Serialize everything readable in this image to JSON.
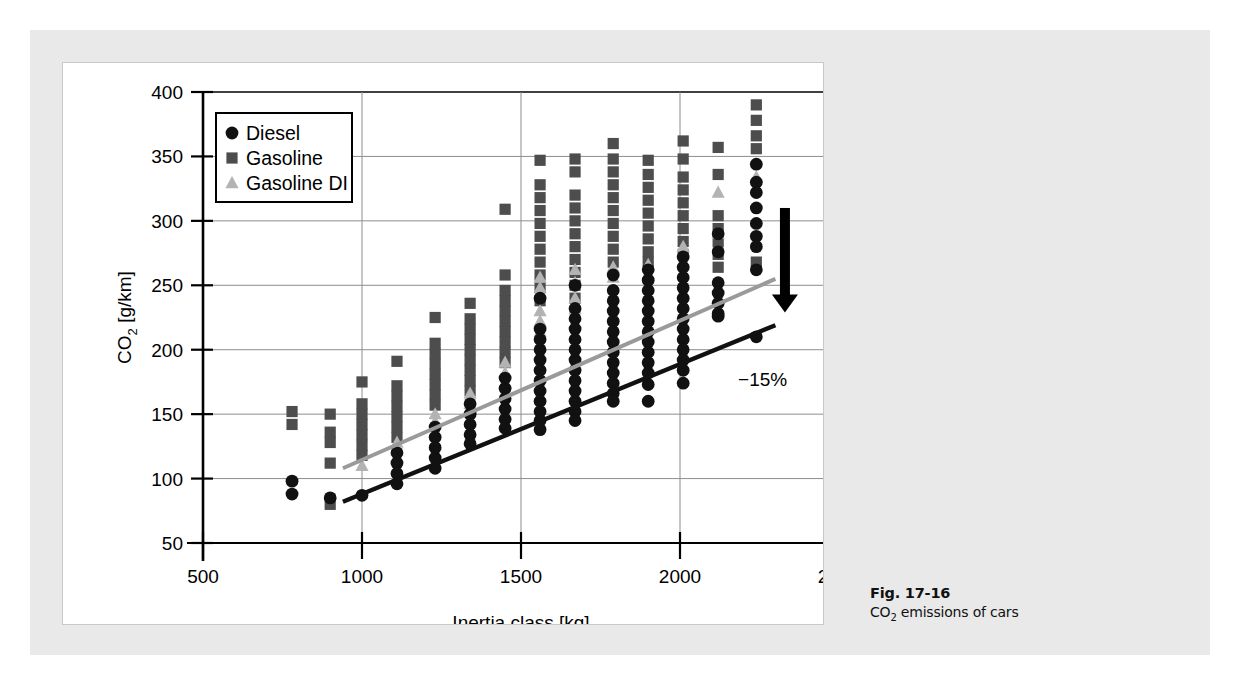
{
  "figure": {
    "caption_number": "Fig. 17-16",
    "caption_text_pre": "CO",
    "caption_text_sub": "2",
    "caption_text_post": " emissions of cars"
  },
  "colors": {
    "diesel": "#111111",
    "gasoline": "#4d4d4d",
    "gasoline_di": "#b3b3b3",
    "trend_diesel": "#111111",
    "trend_gasoline": "#9a9a9a",
    "panel_bg": "#e9e9e9",
    "plot_bg": "#ffffff",
    "grid": "#8d8d8d",
    "axis": "#000000"
  },
  "legend": {
    "position": "top-left-inside",
    "items": [
      {
        "label": "Diesel",
        "marker": "circle",
        "color": "#111111"
      },
      {
        "label": "Gasoline",
        "marker": "square",
        "color": "#4d4d4d"
      },
      {
        "label": "Gasoline DI",
        "marker": "triangle",
        "color": "#b3b3b3"
      }
    ]
  },
  "annotations": [
    {
      "name": "reduction-label",
      "text": "−15%",
      "x": 2260,
      "y": 172
    },
    {
      "name": "down-arrow",
      "text": "arrow-down-icon",
      "x": 2330,
      "y": 255
    }
  ],
  "chart_data": {
    "type": "scatter",
    "title": "",
    "xlabel": "Inertia class [kg]",
    "ylabel": "CO2 [g/km]",
    "ylabel_pre": "CO",
    "ylabel_sub": "2",
    "ylabel_post": " [g/km]",
    "xlim": [
      500,
      2500
    ],
    "ylim": [
      50,
      400
    ],
    "xticks": [
      500,
      1000,
      1500,
      2000,
      2500
    ],
    "yticks": [
      50,
      100,
      150,
      200,
      250,
      300,
      350,
      400
    ],
    "grid": true,
    "legend_position": "upper left",
    "series": [
      {
        "name": "Diesel",
        "marker": "circle",
        "color": "#111111",
        "points": [
          [
            780,
            98
          ],
          [
            780,
            88
          ],
          [
            900,
            85
          ],
          [
            1000,
            87
          ],
          [
            1110,
            120
          ],
          [
            1110,
            112
          ],
          [
            1110,
            104
          ],
          [
            1110,
            96
          ],
          [
            1230,
            140
          ],
          [
            1230,
            132
          ],
          [
            1230,
            124
          ],
          [
            1230,
            116
          ],
          [
            1230,
            108
          ],
          [
            1340,
            158
          ],
          [
            1340,
            150
          ],
          [
            1340,
            142
          ],
          [
            1340,
            134
          ],
          [
            1340,
            127
          ],
          [
            1450,
            178
          ],
          [
            1450,
            170
          ],
          [
            1450,
            162
          ],
          [
            1450,
            154
          ],
          [
            1450,
            146
          ],
          [
            1450,
            139
          ],
          [
            1560,
            240
          ],
          [
            1560,
            216
          ],
          [
            1560,
            208
          ],
          [
            1560,
            200
          ],
          [
            1560,
            192
          ],
          [
            1560,
            184
          ],
          [
            1560,
            176
          ],
          [
            1560,
            168
          ],
          [
            1560,
            160
          ],
          [
            1560,
            152
          ],
          [
            1560,
            145
          ],
          [
            1560,
            138
          ],
          [
            1670,
            250
          ],
          [
            1670,
            232
          ],
          [
            1670,
            224
          ],
          [
            1670,
            216
          ],
          [
            1670,
            208
          ],
          [
            1670,
            200
          ],
          [
            1670,
            192
          ],
          [
            1670,
            184
          ],
          [
            1670,
            176
          ],
          [
            1670,
            168
          ],
          [
            1670,
            160
          ],
          [
            1670,
            152
          ],
          [
            1670,
            145
          ],
          [
            1790,
            258
          ],
          [
            1790,
            246
          ],
          [
            1790,
            238
          ],
          [
            1790,
            230
          ],
          [
            1790,
            222
          ],
          [
            1790,
            214
          ],
          [
            1790,
            206
          ],
          [
            1790,
            198
          ],
          [
            1790,
            190
          ],
          [
            1790,
            182
          ],
          [
            1790,
            174
          ],
          [
            1790,
            166
          ],
          [
            1790,
            160
          ],
          [
            1900,
            262
          ],
          [
            1900,
            254
          ],
          [
            1900,
            246
          ],
          [
            1900,
            238
          ],
          [
            1900,
            230
          ],
          [
            1900,
            222
          ],
          [
            1900,
            214
          ],
          [
            1900,
            206
          ],
          [
            1900,
            198
          ],
          [
            1900,
            190
          ],
          [
            1900,
            182
          ],
          [
            1900,
            173
          ],
          [
            1900,
            160
          ],
          [
            2010,
            272
          ],
          [
            2010,
            264
          ],
          [
            2010,
            256
          ],
          [
            2010,
            248
          ],
          [
            2010,
            240
          ],
          [
            2010,
            232
          ],
          [
            2010,
            224
          ],
          [
            2010,
            216
          ],
          [
            2010,
            208
          ],
          [
            2010,
            200
          ],
          [
            2010,
            192
          ],
          [
            2010,
            184
          ],
          [
            2010,
            174
          ],
          [
            2120,
            290
          ],
          [
            2120,
            276
          ],
          [
            2120,
            252
          ],
          [
            2120,
            244
          ],
          [
            2120,
            236
          ],
          [
            2120,
            228
          ],
          [
            2120,
            226
          ],
          [
            2240,
            344
          ],
          [
            2240,
            330
          ],
          [
            2240,
            322
          ],
          [
            2240,
            310
          ],
          [
            2240,
            298
          ],
          [
            2240,
            288
          ],
          [
            2240,
            280
          ],
          [
            2240,
            262
          ],
          [
            2240,
            210
          ]
        ]
      },
      {
        "name": "Gasoline",
        "marker": "square",
        "color": "#4d4d4d",
        "points": [
          [
            780,
            152
          ],
          [
            780,
            142
          ],
          [
            900,
            150
          ],
          [
            900,
            136
          ],
          [
            900,
            128
          ],
          [
            900,
            112
          ],
          [
            900,
            80
          ],
          [
            1000,
            175
          ],
          [
            1000,
            158
          ],
          [
            1000,
            150
          ],
          [
            1000,
            142
          ],
          [
            1000,
            134
          ],
          [
            1000,
            126
          ],
          [
            1000,
            118
          ],
          [
            1110,
            191
          ],
          [
            1110,
            172
          ],
          [
            1110,
            164
          ],
          [
            1110,
            156
          ],
          [
            1110,
            148
          ],
          [
            1110,
            140
          ],
          [
            1110,
            132
          ],
          [
            1230,
            225
          ],
          [
            1230,
            205
          ],
          [
            1230,
            197
          ],
          [
            1230,
            189
          ],
          [
            1230,
            181
          ],
          [
            1230,
            173
          ],
          [
            1230,
            165
          ],
          [
            1230,
            157
          ],
          [
            1340,
            236
          ],
          [
            1340,
            224
          ],
          [
            1340,
            216
          ],
          [
            1340,
            208
          ],
          [
            1340,
            200
          ],
          [
            1340,
            192
          ],
          [
            1340,
            184
          ],
          [
            1340,
            176
          ],
          [
            1340,
            168
          ],
          [
            1450,
            309
          ],
          [
            1450,
            258
          ],
          [
            1450,
            246
          ],
          [
            1450,
            238
          ],
          [
            1450,
            230
          ],
          [
            1450,
            222
          ],
          [
            1450,
            214
          ],
          [
            1450,
            206
          ],
          [
            1450,
            198
          ],
          [
            1450,
            190
          ],
          [
            1560,
            347
          ],
          [
            1560,
            328
          ],
          [
            1560,
            318
          ],
          [
            1560,
            308
          ],
          [
            1560,
            298
          ],
          [
            1560,
            288
          ],
          [
            1560,
            278
          ],
          [
            1560,
            268
          ],
          [
            1560,
            258
          ],
          [
            1560,
            248
          ],
          [
            1560,
            238
          ],
          [
            1670,
            348
          ],
          [
            1670,
            338
          ],
          [
            1670,
            320
          ],
          [
            1670,
            310
          ],
          [
            1670,
            300
          ],
          [
            1670,
            290
          ],
          [
            1670,
            280
          ],
          [
            1670,
            270
          ],
          [
            1670,
            260
          ],
          [
            1670,
            250
          ],
          [
            1670,
            240
          ],
          [
            1790,
            360
          ],
          [
            1790,
            348
          ],
          [
            1790,
            338
          ],
          [
            1790,
            328
          ],
          [
            1790,
            318
          ],
          [
            1790,
            308
          ],
          [
            1790,
            298
          ],
          [
            1790,
            288
          ],
          [
            1790,
            278
          ],
          [
            1790,
            268
          ],
          [
            1900,
            347
          ],
          [
            1900,
            336
          ],
          [
            1900,
            326
          ],
          [
            1900,
            316
          ],
          [
            1900,
            306
          ],
          [
            1900,
            296
          ],
          [
            1900,
            286
          ],
          [
            1900,
            276
          ],
          [
            1900,
            268
          ],
          [
            2010,
            362
          ],
          [
            2010,
            348
          ],
          [
            2010,
            334
          ],
          [
            2010,
            324
          ],
          [
            2010,
            314
          ],
          [
            2010,
            304
          ],
          [
            2010,
            294
          ],
          [
            2010,
            284
          ],
          [
            2010,
            274
          ],
          [
            2120,
            357
          ],
          [
            2120,
            336
          ],
          [
            2120,
            304
          ],
          [
            2120,
            294
          ],
          [
            2120,
            284
          ],
          [
            2120,
            274
          ],
          [
            2120,
            264
          ],
          [
            2240,
            390
          ],
          [
            2240,
            378
          ],
          [
            2240,
            366
          ],
          [
            2240,
            356
          ],
          [
            2240,
            268
          ]
        ]
      },
      {
        "name": "Gasoline DI",
        "marker": "triangle",
        "color": "#b3b3b3",
        "points": [
          [
            1000,
            110
          ],
          [
            1110,
            128
          ],
          [
            1110,
            122
          ],
          [
            1230,
            150
          ],
          [
            1230,
            144
          ],
          [
            1340,
            166
          ],
          [
            1340,
            158
          ],
          [
            1450,
            190
          ],
          [
            1450,
            182
          ],
          [
            1450,
            174
          ],
          [
            1560,
            256
          ],
          [
            1560,
            248
          ],
          [
            1560,
            230
          ],
          [
            1560,
            222
          ],
          [
            1560,
            214
          ],
          [
            1670,
            262
          ],
          [
            1670,
            252
          ],
          [
            1670,
            240
          ],
          [
            1670,
            232
          ],
          [
            1790,
            264
          ],
          [
            1790,
            256
          ],
          [
            1900,
            266
          ],
          [
            2010,
            280
          ],
          [
            2120,
            322
          ],
          [
            2120,
            290
          ],
          [
            2240,
            334
          ]
        ]
      }
    ],
    "trendlines": [
      {
        "name": "Gasoline trend",
        "color": "#9a9a9a",
        "x0": 940,
        "y0": 108,
        "x1": 2300,
        "y1": 255
      },
      {
        "name": "Diesel trend",
        "color": "#111111",
        "x0": 940,
        "y0": 82,
        "x1": 2300,
        "y1": 219
      }
    ]
  }
}
